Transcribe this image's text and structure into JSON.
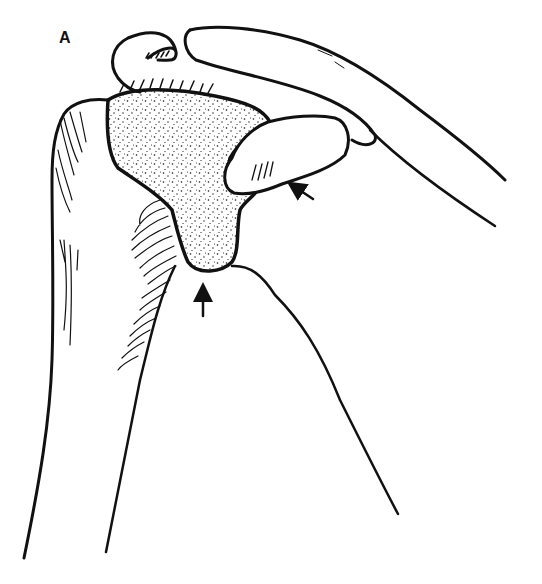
{
  "figure": {
    "panel_label": "A",
    "colors": {
      "ink": "#111111",
      "background": "#ffffff"
    },
    "arrows": [
      {
        "name": "lateral-arrow",
        "direction": "up-left",
        "tail": [
          313,
          199
        ],
        "head": [
          291,
          184
        ]
      },
      {
        "name": "inferior-arrow",
        "direction": "up",
        "tail": [
          203,
          316
        ],
        "head": [
          203,
          286
        ]
      }
    ]
  }
}
